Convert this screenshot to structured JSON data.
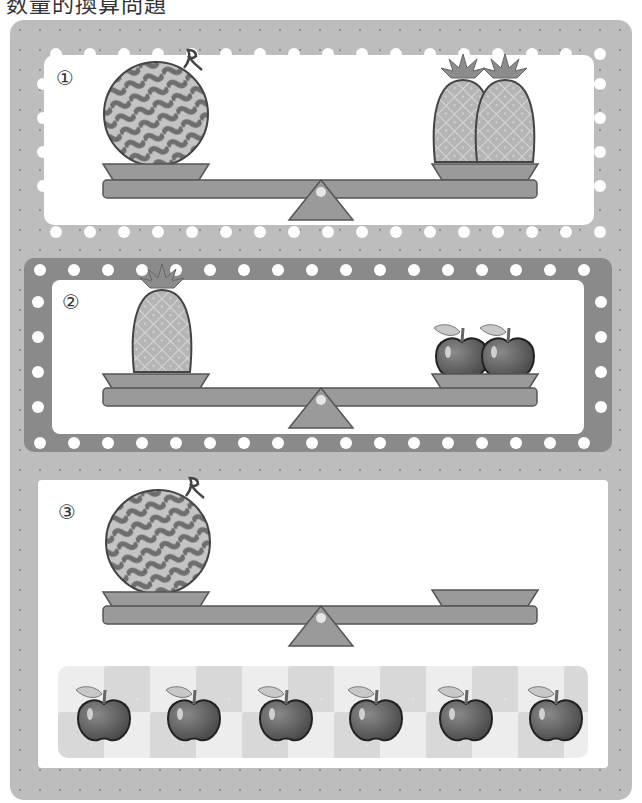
{
  "header": {
    "title": "数量的換算問題"
  },
  "problems": [
    {
      "number": "①",
      "left_pan": {
        "item": "watermelon",
        "count": 1
      },
      "right_pan": {
        "item": "pineapple",
        "count": 2
      },
      "state": "balanced"
    },
    {
      "number": "②",
      "left_pan": {
        "item": "pineapple",
        "count": 1
      },
      "right_pan": {
        "item": "apple",
        "count": 2
      },
      "state": "balanced"
    },
    {
      "number": "③",
      "left_pan": {
        "item": "watermelon",
        "count": 1
      },
      "right_pan": {
        "item": "empty",
        "count": 0
      },
      "state": "balanced"
    }
  ],
  "answer_choices": {
    "item": "apple",
    "count": 6
  },
  "colors": {
    "frame": "#bdbdbd",
    "panel2_border": "#8a8a8a",
    "beam": "#9a9a9a",
    "stroke": "#555555",
    "panel": "#ffffff"
  }
}
